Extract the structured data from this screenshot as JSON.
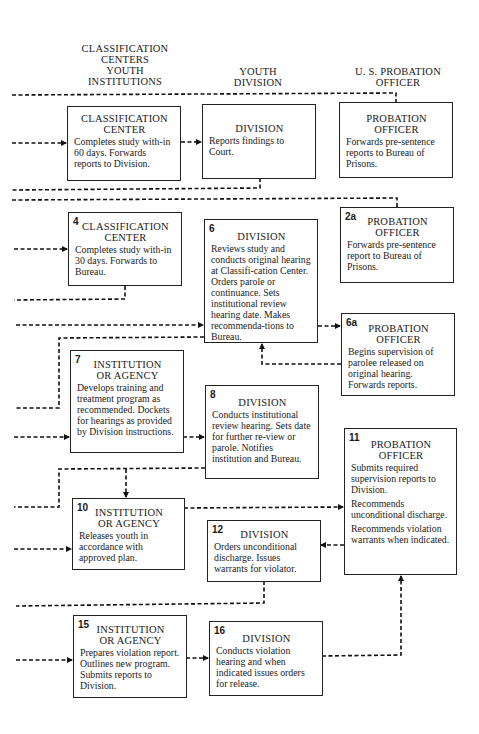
{
  "columns": {
    "left": "CLASSIFICATION CENTERS YOUTH INSTITUTIONS",
    "left_lines": [
      "CLASSIFICATION",
      "CENTERS",
      "YOUTH",
      "INSTITUTIONS"
    ],
    "middle_lines": [
      "YOUTH",
      "DIVISION"
    ],
    "right_lines": [
      "U. S. PROBATION",
      "OFFICER"
    ]
  },
  "boxes": {
    "b1": {
      "num": "",
      "title": [
        "CLASSIFICATION",
        "CENTER"
      ],
      "desc": [
        "Completes study with-in 60 days. Forwards reports to Division."
      ]
    },
    "b2": {
      "num": "",
      "title": [
        "DIVISION"
      ],
      "desc": [
        "Reports findings to Court."
      ]
    },
    "b3": {
      "num": "",
      "title": [
        "PROBATION",
        "OFFICER"
      ],
      "desc": [
        "Forwards pre-sentence reports to Bureau of Prisons."
      ]
    },
    "b4": {
      "num": "4",
      "title": [
        "CLASSIFICATION",
        "CENTER"
      ],
      "desc": [
        "Completes study with-in 30 days. Forwards to Bureau."
      ]
    },
    "b2a": {
      "num": "2a",
      "title": [
        "PROBATION",
        "OFFICER"
      ],
      "desc": [
        "Forwards pre-sentence report to Bureau of Prisons."
      ]
    },
    "b6": {
      "num": "6",
      "title": [
        "DIVISION"
      ],
      "desc": [
        "Reviews study and conducts original hearing at Classifi-cation Center. Orders parole or continuance. Sets institutional review hearing date. Makes recommenda-tions to Bureau."
      ]
    },
    "b6a": {
      "num": "6a",
      "title": [
        "PROBATION",
        "OFFICER"
      ],
      "desc": [
        "Begins supervision of parolee released on original hearing. Forwards reports."
      ]
    },
    "b7": {
      "num": "7",
      "title": [
        "INSTITUTION",
        "OR AGENCY"
      ],
      "desc": [
        "Develops training and treatment program as recommended. Dockets for hearings as provided by Division instructions."
      ]
    },
    "b8": {
      "num": "8",
      "title": [
        "DIVISION"
      ],
      "desc": [
        "Conducts institutional review hearing. Sets date for further re-view or parole. Notifies institution and Bureau."
      ]
    },
    "b11": {
      "num": "11",
      "title": [
        "PROBATION",
        "OFFICER"
      ],
      "desc": [
        "Submits required supervision reports to Division.",
        "Recommends unconditional discharge.",
        "Recommends violation warrants when indicated."
      ]
    },
    "b10": {
      "num": "10",
      "title": [
        "INSTITUTION",
        "OR AGENCY"
      ],
      "desc": [
        "Releases youth in accordance with approved plan."
      ]
    },
    "b12": {
      "num": "12",
      "title": [
        "DIVISION"
      ],
      "desc": [
        "Orders unconditional discharge. Issues warrants for violator."
      ]
    },
    "b15": {
      "num": "15",
      "title": [
        "INSTITUTION",
        "OR AGENCY"
      ],
      "desc": [
        "Prepares violation report. Outlines new program. Submits reports to Division."
      ]
    },
    "b16": {
      "num": "16",
      "title": [
        "DIVISION"
      ],
      "desc": [
        "Conducts violation hearing and when indicated issues orders for release."
      ]
    }
  },
  "colors": {
    "ink": "#1a1a1a",
    "background": "#ffffff"
  }
}
